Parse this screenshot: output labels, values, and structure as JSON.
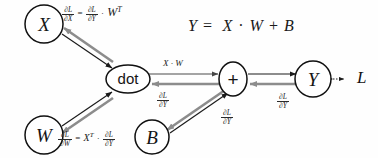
{
  "diagram": {
    "main_equation": {
      "lhs": "Y",
      "equals": "=",
      "rhs_x": "X",
      "dot_op": "·",
      "rhs_w": "W",
      "plus_op": "+",
      "rhs_b": "B"
    },
    "nodes": [
      {
        "id": "X",
        "label": "X",
        "shape": "circle"
      },
      {
        "id": "W",
        "label": "W",
        "shape": "circle"
      },
      {
        "id": "B",
        "label": "B",
        "shape": "circle"
      },
      {
        "id": "dot",
        "label": "dot",
        "shape": "ellipse"
      },
      {
        "id": "plus",
        "label": "+",
        "shape": "ellipse"
      },
      {
        "id": "Y",
        "label": "Y",
        "shape": "circle"
      },
      {
        "id": "L",
        "label": "L",
        "shape": "text"
      }
    ],
    "edges": [
      {
        "from": "X",
        "to": "dot",
        "direction": "forward",
        "color": "#1b1b1b"
      },
      {
        "from": "dot",
        "to": "X",
        "direction": "backward",
        "color": "#8c8c8c"
      },
      {
        "from": "W",
        "to": "dot",
        "direction": "forward",
        "color": "#1b1b1b"
      },
      {
        "from": "dot",
        "to": "W",
        "direction": "backward",
        "color": "#8c8c8c"
      },
      {
        "from": "dot",
        "to": "plus",
        "direction": "forward",
        "color": "#4a4a4a"
      },
      {
        "from": "plus",
        "to": "dot",
        "direction": "backward",
        "color": "#8c8c8c"
      },
      {
        "from": "B",
        "to": "plus",
        "direction": "forward",
        "color": "#1b1b1b"
      },
      {
        "from": "plus",
        "to": "B",
        "direction": "backward",
        "color": "#8c8c8c"
      },
      {
        "from": "plus",
        "to": "Y",
        "direction": "forward",
        "color": "#1b1b1b"
      },
      {
        "from": "Y",
        "to": "plus",
        "direction": "backward",
        "color": "#8c8c8c"
      },
      {
        "from": "Y",
        "to": "L",
        "direction": "bidirectional-dotted",
        "color": "#1b1b1b"
      }
    ],
    "grad_x_formula": {
      "lhs_num": "∂L",
      "lhs_den": "∂X",
      "equals": "=",
      "rhs_num": "∂L",
      "rhs_den": "∂Y",
      "dot_op": "·",
      "rhs_term": "W",
      "rhs_sup": "T"
    },
    "grad_w_formula": {
      "lhs_num": "∂L",
      "lhs_den": "∂W",
      "equals": "=",
      "rhs_term": "X",
      "rhs_sup": "T",
      "dot_op": "·",
      "rhs_num": "∂L",
      "rhs_den": "∂Y"
    },
    "edge_labels": {
      "forward_dot_to_plus": "X · W",
      "grad_dot_num": "∂L",
      "grad_dot_den": "∂Y",
      "grad_b_num": "∂L",
      "grad_b_den": "∂Y",
      "grad_y_num": "∂L",
      "grad_y_den": "∂Y"
    },
    "colors": {
      "background": "#fefefe",
      "forward_arrow": "#1b1b1b",
      "backward_arrow": "#8c8c8c",
      "node_stroke": "#101010",
      "node_fill": "#ffffff",
      "text": "#1a1a1a"
    }
  }
}
